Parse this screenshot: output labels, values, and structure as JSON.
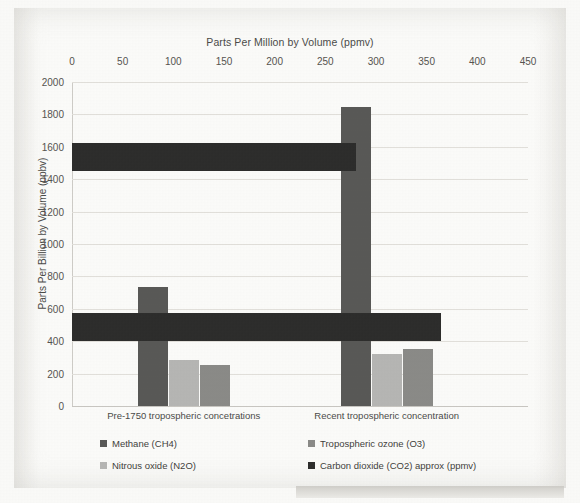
{
  "chart_data": {
    "type": "bar",
    "title": "",
    "categories": [
      "Pre-1750 tropospheric concetrations",
      "Recent tropospheric concentration"
    ],
    "series": [
      {
        "name": "Methane (CH4)",
        "color": "#585856",
        "axis": "ppbv",
        "values": [
          733,
          1843
        ]
      },
      {
        "name": "Nitrous oxide (N2O)",
        "color": "#b6b6b4",
        "axis": "ppbv",
        "values": [
          286,
          320
        ]
      },
      {
        "name": "Tropospheric ozone (O3)",
        "color": "#8a8a87",
        "axis": "ppbv",
        "values": [
          255,
          350
        ]
      },
      {
        "name": "Carbon dioxide (CO2) approx (ppmv)",
        "color": "#2c2c2b",
        "axis": "ppmv",
        "values": [
          280,
          364
        ]
      }
    ],
    "xlabel": "Parts Per Million by Volume (ppmv)",
    "ylabel": "Parts Per Billion by Volume (ppbv)",
    "xlim": [
      0,
      450
    ],
    "ylim": [
      0,
      2000
    ],
    "xticks": [
      "0",
      "50",
      "100",
      "150",
      "200",
      "250",
      "300",
      "350",
      "400",
      "450"
    ],
    "yticks": [
      "0",
      "200",
      "400",
      "600",
      "800",
      "1000",
      "1200",
      "1400",
      "1600",
      "1800",
      "2000"
    ],
    "grid": true,
    "legend_position": "bottom",
    "x_axis_position": "top"
  },
  "axes": {
    "top_title": "Parts Per Million by Volume (ppmv)",
    "left_title": "Parts Per Billion by Volume (ppbv)"
  },
  "legend": {
    "items": [
      {
        "label": "Methane (CH4)",
        "color": "#585856"
      },
      {
        "label": "Nitrous oxide (N2O)",
        "color": "#b6b6b4"
      },
      {
        "label": "Tropospheric ozone (O3)",
        "color": "#8a8a87"
      },
      {
        "label": "Carbon dioxide (CO2) approx (ppmv)",
        "color": "#2c2c2b"
      }
    ]
  }
}
